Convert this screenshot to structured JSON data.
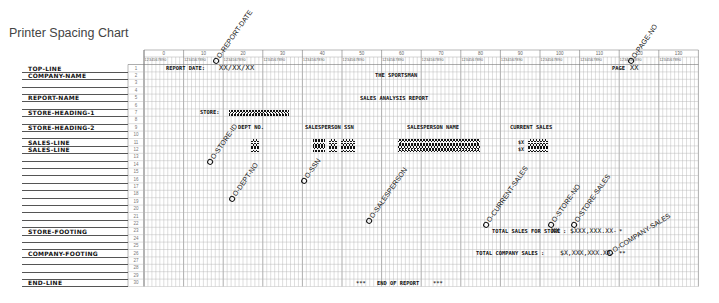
{
  "title": "Printer Spacing Chart",
  "header_blocks": [
    "0",
    "10",
    "20",
    "30",
    "40",
    "50",
    "60",
    "70",
    "80",
    "90",
    "100",
    "110",
    "120",
    "130"
  ],
  "header_digits": "1234567890",
  "row_numbers": [
    "1",
    "2",
    "3",
    "4",
    "5",
    "6",
    "7",
    "8",
    "9",
    "10",
    "11",
    "12",
    "13",
    "14",
    "15",
    "16",
    "17",
    "18",
    "19",
    "20",
    "21",
    "22",
    "23",
    "24",
    "25",
    "26",
    "27",
    "28",
    "29",
    "30"
  ],
  "row_labels": {
    "1": "TOP-LINE",
    "2": "COMPANY-NAME",
    "5": "REPORT-NAME",
    "7": "STORE-HEADING-1",
    "9": "STORE-HEADING-2",
    "11": "SALES-LINE",
    "12": "SALES-LINE",
    "23": "STORE-FOOTING",
    "26": "COMPANY-FOOTING",
    "30": "END-LINE"
  },
  "content": {
    "report_date_label": "REPORT DATE:",
    "report_date_mask": "XX/XX/XX",
    "page_label": "PAGE",
    "page_mask": "XX",
    "company_name": "THE SPORTSMAN",
    "report_name": "SALES ANALYSIS REPORT",
    "store_label": "STORE:",
    "store_mask": "XXXXXXXXXXXXXXX",
    "dept_no_header": "DEPT NO.",
    "ssn_header": "SALESPERSON SSN",
    "name_header": "SALESPERSON NAME",
    "sales_header": "CURRENT SALES",
    "store_total_label": "TOTAL SALES FOR STORE",
    "store_total_store_mask": "XX",
    "store_total_colon": ":",
    "store_total_amount_mask": "$XXX,XXX.XX-",
    "store_total_marker": "*",
    "company_total_label": "TOTAL COMPANY SALES :",
    "company_total_amount_mask": "$X,XXX,XXX.XX-",
    "company_total_marker": "**",
    "end_left_marker": "***",
    "end_text": "END OF REPORT",
    "end_right_marker": "***"
  },
  "field_annotations": {
    "report_date": "O-REPORT-DATE",
    "page_no": "O-PAGE-NO",
    "store_id": "O-STORE-ID",
    "dept_no": "O-DEPT-NO",
    "ssn": "O-SSN",
    "salesperson": "O-SALESPERSON",
    "current_sales": "O-CURRENT-SALES",
    "store_no": "O-STORE-NO",
    "store_sales": "O-STORE-SALES",
    "company_sales": "O-COMPANY-SALES"
  },
  "colors": {
    "grid_line": "#b5b5b5",
    "grid_major": "#777777",
    "ink": "#111111",
    "title": "#444444"
  }
}
